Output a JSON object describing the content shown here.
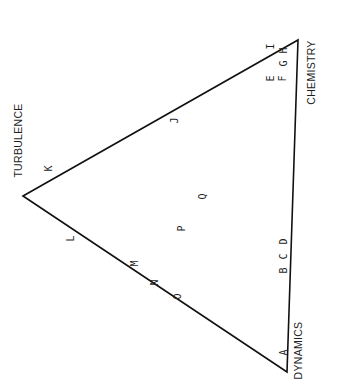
{
  "diagram": {
    "type": "ternary-triangle",
    "vertices": {
      "turbulence": {
        "label": "TURBULENCE",
        "x": 23,
        "y": 196
      },
      "chemistry": {
        "label": "CHEMISTRY",
        "x": 298,
        "y": 40
      },
      "dynamics": {
        "label": "DYNAMICS",
        "x": 287,
        "y": 372
      }
    },
    "line_color": "#111111",
    "points": [
      {
        "id": "A",
        "label": "A",
        "x": 283,
        "y": 352
      },
      {
        "id": "B",
        "label": "B",
        "x": 283,
        "y": 270
      },
      {
        "id": "C",
        "label": "C",
        "x": 283,
        "y": 256
      },
      {
        "id": "D",
        "label": "D",
        "x": 283,
        "y": 241
      },
      {
        "id": "E",
        "label": "E",
        "x": 270,
        "y": 78
      },
      {
        "id": "F",
        "label": "F",
        "x": 282,
        "y": 78
      },
      {
        "id": "G",
        "label": "G",
        "x": 283,
        "y": 63
      },
      {
        "id": "H",
        "label": "H",
        "x": 283,
        "y": 50
      },
      {
        "id": "I",
        "label": "I",
        "x": 270,
        "y": 46
      },
      {
        "id": "J",
        "label": "J",
        "x": 174,
        "y": 120
      },
      {
        "id": "K",
        "label": "K",
        "x": 48,
        "y": 168
      },
      {
        "id": "L",
        "label": "L",
        "x": 70,
        "y": 238
      },
      {
        "id": "M",
        "label": "M",
        "x": 134,
        "y": 263
      },
      {
        "id": "N",
        "label": "N",
        "x": 154,
        "y": 282
      },
      {
        "id": "O",
        "label": "O",
        "x": 177,
        "y": 296
      },
      {
        "id": "P",
        "label": "P",
        "x": 181,
        "y": 228
      },
      {
        "id": "Q",
        "label": "Q",
        "x": 202,
        "y": 196
      }
    ]
  }
}
